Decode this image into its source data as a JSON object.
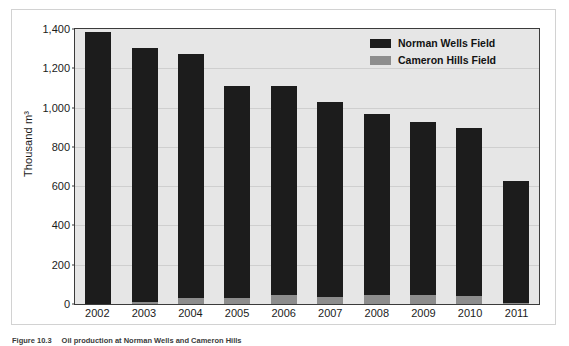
{
  "chart_data": {
    "type": "bar",
    "stacked": true,
    "title": "",
    "xlabel": "",
    "ylabel": "Thousand m³",
    "categories": [
      "2002",
      "2003",
      "2004",
      "2005",
      "2006",
      "2007",
      "2008",
      "2009",
      "2010",
      "2011"
    ],
    "ylim": [
      0,
      1400
    ],
    "yticks": [
      0,
      200,
      400,
      600,
      800,
      1000,
      1200,
      1400
    ],
    "ytick_labels": [
      "0",
      "200",
      "400",
      "600",
      "800",
      "1,000",
      "1,200",
      "1,400"
    ],
    "grid": false,
    "legend_position": "top-right",
    "series": [
      {
        "name": "Norman Wells Field",
        "color": "#1c1c1c",
        "values": [
          1385,
          1295,
          1245,
          1080,
          1065,
          995,
          920,
          880,
          855,
          620
        ]
      },
      {
        "name": "Cameron Hills Field",
        "color": "#8d8d8d",
        "values": [
          0,
          10,
          30,
          30,
          45,
          35,
          45,
          45,
          40,
          5
        ]
      }
    ],
    "totals": [
      1385,
      1305,
      1275,
      1110,
      1110,
      1030,
      965,
      925,
      895,
      625
    ]
  },
  "legend": {
    "items": [
      {
        "label": "Norman Wells Field",
        "color": "#1c1c1c"
      },
      {
        "label": "Cameron Hills Field",
        "color": "#8d8d8d"
      }
    ]
  },
  "caption": {
    "number": "Figure 10.3",
    "text": "Oil production at Norman Wells and Cameron Hills"
  }
}
